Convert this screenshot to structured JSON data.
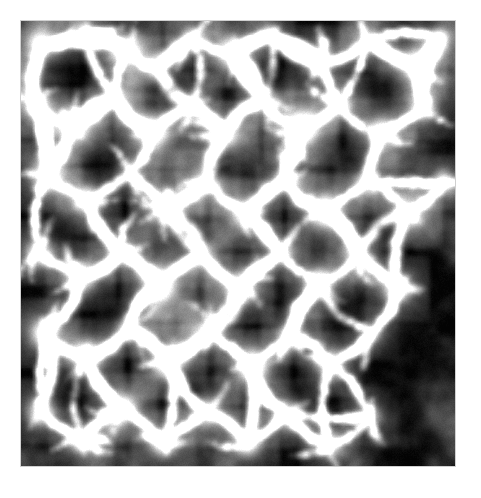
{
  "page": {
    "background_color": "#ffffff",
    "width": 481,
    "height": 498
  },
  "figure": {
    "name": "cosmic-web-simulation",
    "kind": "grayscale-density-map",
    "description": "Grayscale projected density map of a cosmological N-body simulation showing the cosmic web: bright filaments and knots surrounding dark voids.",
    "plate": {
      "left": 21,
      "top": 21,
      "width": 434,
      "height": 445,
      "void_color": "#050505",
      "filament_color": "#ffffff",
      "mid_color": "#8a8a8a",
      "border_color": "#aaaaaa"
    },
    "image_data": {
      "type": "heatmap",
      "colormap": "grayscale",
      "value_range": [
        0,
        1
      ],
      "grid": [
        434,
        445
      ],
      "background_level": 0.02,
      "diffuse_haze_level": 0.14,
      "filament_peak_level": 1.0,
      "nodes": [
        {
          "x": 0.05,
          "y": 0.055,
          "r": 0.055,
          "i": 0.62
        },
        {
          "x": 0.145,
          "y": 0.03,
          "r": 0.04,
          "i": 0.55
        },
        {
          "x": 0.24,
          "y": 0.062,
          "r": 0.05,
          "i": 0.72
        },
        {
          "x": 0.315,
          "y": 0.105,
          "r": 0.045,
          "i": 0.66
        },
        {
          "x": 0.395,
          "y": 0.04,
          "r": 0.038,
          "i": 0.5
        },
        {
          "x": 0.492,
          "y": 0.07,
          "r": 0.05,
          "i": 0.78
        },
        {
          "x": 0.575,
          "y": 0.03,
          "r": 0.035,
          "i": 0.52
        },
        {
          "x": 0.69,
          "y": 0.09,
          "r": 0.048,
          "i": 0.7
        },
        {
          "x": 0.8,
          "y": 0.045,
          "r": 0.042,
          "i": 0.6
        },
        {
          "x": 0.905,
          "y": 0.1,
          "r": 0.05,
          "i": 0.74
        },
        {
          "x": 0.965,
          "y": 0.04,
          "r": 0.036,
          "i": 0.58
        },
        {
          "x": 0.035,
          "y": 0.185,
          "r": 0.046,
          "i": 0.64
        },
        {
          "x": 0.12,
          "y": 0.235,
          "r": 0.055,
          "i": 0.8
        },
        {
          "x": 0.215,
          "y": 0.17,
          "r": 0.04,
          "i": 0.56
        },
        {
          "x": 0.3,
          "y": 0.245,
          "r": 0.052,
          "i": 0.75
        },
        {
          "x": 0.39,
          "y": 0.19,
          "r": 0.044,
          "i": 0.62
        },
        {
          "x": 0.47,
          "y": 0.255,
          "r": 0.05,
          "i": 0.72
        },
        {
          "x": 0.56,
          "y": 0.175,
          "r": 0.042,
          "i": 0.6
        },
        {
          "x": 0.645,
          "y": 0.24,
          "r": 0.055,
          "i": 0.82
        },
        {
          "x": 0.735,
          "y": 0.185,
          "r": 0.04,
          "i": 0.58
        },
        {
          "x": 0.83,
          "y": 0.25,
          "r": 0.048,
          "i": 0.7
        },
        {
          "x": 0.93,
          "y": 0.195,
          "r": 0.044,
          "i": 0.66
        },
        {
          "x": 0.06,
          "y": 0.35,
          "r": 0.05,
          "i": 0.7
        },
        {
          "x": 0.155,
          "y": 0.405,
          "r": 0.046,
          "i": 0.65
        },
        {
          "x": 0.25,
          "y": 0.34,
          "r": 0.042,
          "i": 0.58
        },
        {
          "x": 0.335,
          "y": 0.42,
          "r": 0.052,
          "i": 0.76
        },
        {
          "x": 0.43,
          "y": 0.36,
          "r": 0.046,
          "i": 0.64
        },
        {
          "x": 0.52,
          "y": 0.43,
          "r": 0.05,
          "i": 0.72
        },
        {
          "x": 0.61,
          "y": 0.355,
          "r": 0.042,
          "i": 0.6
        },
        {
          "x": 0.7,
          "y": 0.425,
          "r": 0.054,
          "i": 0.8
        },
        {
          "x": 0.795,
          "y": 0.36,
          "r": 0.044,
          "i": 0.62
        },
        {
          "x": 0.89,
          "y": 0.43,
          "r": 0.05,
          "i": 0.74
        },
        {
          "x": 0.975,
          "y": 0.365,
          "r": 0.038,
          "i": 0.56
        },
        {
          "x": 0.04,
          "y": 0.52,
          "r": 0.046,
          "i": 0.64
        },
        {
          "x": 0.135,
          "y": 0.575,
          "r": 0.05,
          "i": 0.72
        },
        {
          "x": 0.23,
          "y": 0.515,
          "r": 0.044,
          "i": 0.62
        },
        {
          "x": 0.32,
          "y": 0.59,
          "r": 0.052,
          "i": 0.78
        },
        {
          "x": 0.415,
          "y": 0.525,
          "r": 0.044,
          "i": 0.6
        },
        {
          "x": 0.505,
          "y": 0.6,
          "r": 0.05,
          "i": 0.74
        },
        {
          "x": 0.6,
          "y": 0.52,
          "r": 0.042,
          "i": 0.58
        },
        {
          "x": 0.69,
          "y": 0.59,
          "r": 0.05,
          "i": 0.7
        },
        {
          "x": 0.78,
          "y": 0.52,
          "r": 0.044,
          "i": 0.62
        },
        {
          "x": 0.87,
          "y": 0.6,
          "r": 0.046,
          "i": 0.66
        },
        {
          "x": 0.055,
          "y": 0.7,
          "r": 0.048,
          "i": 0.68
        },
        {
          "x": 0.15,
          "y": 0.755,
          "r": 0.052,
          "i": 0.78
        },
        {
          "x": 0.245,
          "y": 0.69,
          "r": 0.042,
          "i": 0.58
        },
        {
          "x": 0.34,
          "y": 0.765,
          "r": 0.054,
          "i": 0.84
        },
        {
          "x": 0.435,
          "y": 0.7,
          "r": 0.044,
          "i": 0.62
        },
        {
          "x": 0.53,
          "y": 0.775,
          "r": 0.052,
          "i": 0.8
        },
        {
          "x": 0.62,
          "y": 0.705,
          "r": 0.042,
          "i": 0.6
        },
        {
          "x": 0.715,
          "y": 0.77,
          "r": 0.046,
          "i": 0.66
        },
        {
          "x": 0.81,
          "y": 0.7,
          "r": 0.038,
          "i": 0.48
        },
        {
          "x": 0.045,
          "y": 0.88,
          "r": 0.046,
          "i": 0.64
        },
        {
          "x": 0.14,
          "y": 0.94,
          "r": 0.044,
          "i": 0.6
        },
        {
          "x": 0.235,
          "y": 0.87,
          "r": 0.048,
          "i": 0.7
        },
        {
          "x": 0.33,
          "y": 0.945,
          "r": 0.046,
          "i": 0.64
        },
        {
          "x": 0.425,
          "y": 0.88,
          "r": 0.05,
          "i": 0.74
        },
        {
          "x": 0.52,
          "y": 0.95,
          "r": 0.044,
          "i": 0.6
        },
        {
          "x": 0.615,
          "y": 0.885,
          "r": 0.048,
          "i": 0.68
        },
        {
          "x": 0.71,
          "y": 0.955,
          "r": 0.042,
          "i": 0.56
        },
        {
          "x": 0.805,
          "y": 0.89,
          "r": 0.04,
          "i": 0.52
        }
      ],
      "voids": [
        {
          "x": 0.115,
          "y": 0.115,
          "r": 0.085
        },
        {
          "x": 0.345,
          "y": 0.15,
          "r": 0.08
        },
        {
          "x": 0.585,
          "y": 0.13,
          "r": 0.07
        },
        {
          "x": 0.84,
          "y": 0.145,
          "r": 0.075
        },
        {
          "x": 0.2,
          "y": 0.32,
          "r": 0.08
        },
        {
          "x": 0.465,
          "y": 0.33,
          "r": 0.07
        },
        {
          "x": 0.76,
          "y": 0.31,
          "r": 0.075
        },
        {
          "x": 0.09,
          "y": 0.47,
          "r": 0.07
        },
        {
          "x": 0.38,
          "y": 0.48,
          "r": 0.07
        },
        {
          "x": 0.83,
          "y": 0.47,
          "r": 0.09
        },
        {
          "x": 0.205,
          "y": 0.655,
          "r": 0.075
        },
        {
          "x": 0.48,
          "y": 0.66,
          "r": 0.065
        },
        {
          "x": 0.75,
          "y": 0.65,
          "r": 0.07
        },
        {
          "x": 0.115,
          "y": 0.83,
          "r": 0.08
        },
        {
          "x": 0.4,
          "y": 0.83,
          "r": 0.075
        },
        {
          "x": 0.64,
          "y": 0.83,
          "r": 0.07
        },
        {
          "x": 0.885,
          "y": 0.84,
          "r": 0.095
        },
        {
          "x": 0.9,
          "y": 0.72,
          "r": 0.085
        }
      ]
    }
  }
}
